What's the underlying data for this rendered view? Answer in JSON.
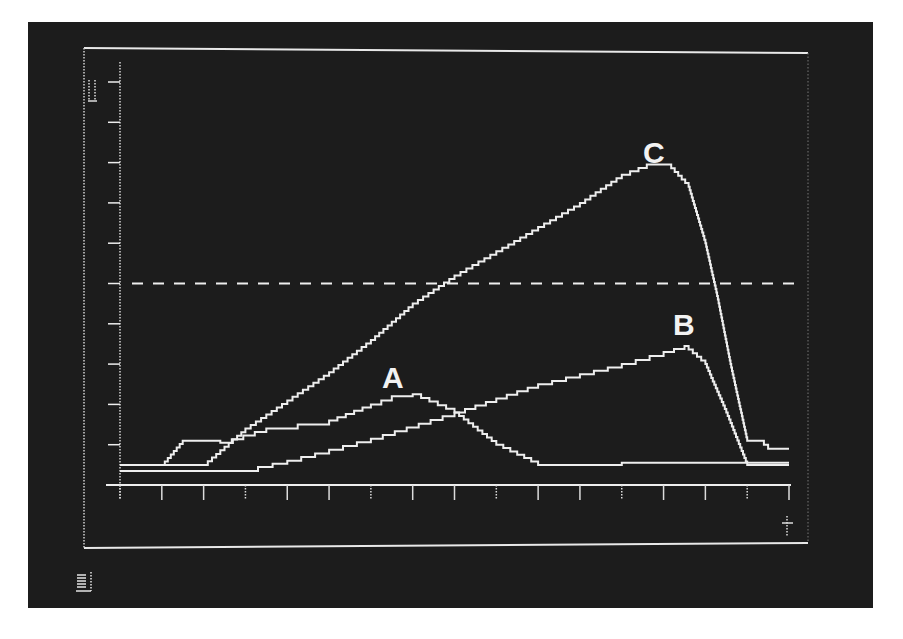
{
  "chart_data": {
    "type": "line",
    "title": "",
    "xlabel": "",
    "ylabel": "",
    "grid": false,
    "legend": "none (curves labeled inline)",
    "style": "monochrome oscilloscope-style display photograph; white stepped traces on black",
    "x_ticks": 17,
    "y_ticks": 11,
    "xlim": [
      0,
      16
    ],
    "ylim": [
      0,
      10
    ],
    "reference_line": {
      "type": "horizontal-dashed",
      "y": 5.0
    },
    "annotations": [
      {
        "text": "A",
        "x": 6.8,
        "y": 2.3
      },
      {
        "text": "B",
        "x": 13.5,
        "y": 3.6
      },
      {
        "text": "C",
        "x": 12.8,
        "y": 8.0
      }
    ],
    "series": [
      {
        "name": "A",
        "x": [
          0,
          1.0,
          1.5,
          2.0,
          2.4,
          3.5,
          5.0,
          6.0,
          6.5,
          7.0,
          8.0,
          9.0,
          10.0,
          12.0,
          16.0
        ],
        "values": [
          0.5,
          0.5,
          1.1,
          1.1,
          1.05,
          1.4,
          1.6,
          2.0,
          2.2,
          2.25,
          1.8,
          1.0,
          0.5,
          0.55,
          0.55
        ]
      },
      {
        "name": "B",
        "x": [
          0,
          2.0,
          3.3,
          4.0,
          6.0,
          8.0,
          10.0,
          12.0,
          13.0,
          13.5,
          14.0,
          14.5,
          15.0,
          16.0
        ],
        "values": [
          0.35,
          0.35,
          0.45,
          0.6,
          1.15,
          1.8,
          2.5,
          3.0,
          3.3,
          3.45,
          3.0,
          1.8,
          0.5,
          0.5
        ]
      },
      {
        "name": "C",
        "x": [
          0,
          2.0,
          3.0,
          4.0,
          5.0,
          6.0,
          7.0,
          8.0,
          9.0,
          10.0,
          11.0,
          12.0,
          12.6,
          13.1,
          13.6,
          14.0,
          14.3,
          14.6,
          15.0,
          15.4,
          15.5,
          16.0
        ],
        "values": [
          0.5,
          0.5,
          1.4,
          2.1,
          2.8,
          3.6,
          4.5,
          5.2,
          5.8,
          6.4,
          7.0,
          7.7,
          7.95,
          7.95,
          7.4,
          6.0,
          4.6,
          3.0,
          1.1,
          1.0,
          0.9,
          0.9
        ]
      }
    ]
  },
  "labels": {
    "curve_a": "A",
    "curve_b": "B",
    "curve_c": "C"
  },
  "glyphs": {
    "top_left_marker": "bracket-glyph",
    "bottom_left_marker": "bar-glyph",
    "bottom_right_marker": "plus-glyph"
  },
  "colors": {
    "background": "#1c1c1c",
    "trace": "#eeeeee",
    "page": "#ffffff"
  }
}
